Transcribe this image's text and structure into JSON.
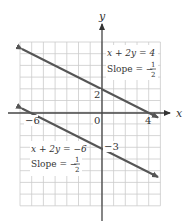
{
  "chart_data": {
    "type": "line",
    "title": "",
    "xlabel": "x",
    "ylabel": "y",
    "xlim": [
      -7,
      5
    ],
    "ylim": [
      -8,
      6
    ],
    "grid": true,
    "tick_labels": {
      "x": [
        "-6",
        "0",
        "4"
      ],
      "y": [
        "2",
        "-3"
      ]
    },
    "series": [
      {
        "name": "x + 2y = 4",
        "equation": "x + 2y = 4",
        "slope": "-1/2",
        "y_intercept": 2,
        "x_intercept": 4,
        "x": [
          -6.8,
          4.8
        ],
        "y": [
          5.4,
          -0.4
        ],
        "arrows": "both"
      },
      {
        "name": "x + 2y = -6",
        "equation": "x + 2y = −6",
        "slope": "-1/2",
        "y_intercept": -3,
        "x_intercept": -6,
        "x": [
          -6.8,
          4.8
        ],
        "y": [
          0.4,
          -5.4
        ],
        "arrows": "both"
      }
    ],
    "annotations": [
      {
        "text": "x + 2y = 4",
        "line2": "Slope = −1/2",
        "position": "upper-right"
      },
      {
        "text": "x + 2y = −6",
        "line2": "Slope = −1/2",
        "position": "lower-left"
      }
    ]
  },
  "labels": {
    "x_axis": "x",
    "y_axis": "y",
    "tick_x_neg6": "−6",
    "tick_x_0": "0",
    "tick_x_4": "4",
    "tick_y_2": "2",
    "tick_y_neg3": "−3",
    "eq1": "x + 2y = 4",
    "eq2": "x + 2y = −6",
    "slope_prefix": "Slope = −",
    "slope_num": "1",
    "slope_den": "2"
  },
  "colors": {
    "line": "#555555",
    "grid": "#cccccc",
    "axis": "#333333"
  }
}
